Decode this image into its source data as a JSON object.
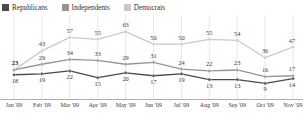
{
  "legend": {
    "items": [
      {
        "label": "Republicans",
        "color": "#4a4a4a",
        "key": "republicans"
      },
      {
        "label": "Independents",
        "color": "#949494",
        "key": "independents"
      },
      {
        "label": "Democrats",
        "color": "#c9c9c9",
        "key": "democrats"
      }
    ]
  },
  "chart_data": {
    "type": "line",
    "title": "",
    "xlabel": "",
    "ylabel": "",
    "ylim": [
      0,
      70
    ],
    "grid": true,
    "legend_position": "top-left",
    "categories": [
      "Jan '09",
      "Feb '09",
      "Mar '09",
      "Apr '09",
      "May '09",
      "Jun '09",
      "Jul '09",
      "Aug '09",
      "Sep '09",
      "Oct '09",
      "Nov '09"
    ],
    "series": [
      {
        "name": "Democrats",
        "color": "#c9c9c9",
        "values": [
          23,
          43,
          57,
          55,
          63,
          50,
          50,
          55,
          54,
          36,
          47
        ]
      },
      {
        "name": "Independents",
        "color": "#949494",
        "values": [
          23,
          29,
          34,
          33,
          29,
          31,
          24,
          22,
          23,
          16,
          17
        ]
      },
      {
        "name": "Republicans",
        "color": "#4a4a4a",
        "values": [
          18,
          19,
          22,
          15,
          20,
          17,
          19,
          13,
          13,
          9,
          14
        ]
      }
    ]
  },
  "axis": {
    "ticks": [
      "Jan '09",
      "Feb '09",
      "Mar '09",
      "Apr '09",
      "May '09",
      "Jun '09",
      "Jul '09",
      "Aug '09",
      "Sep '09",
      "Oct '09",
      "Nov '09"
    ]
  }
}
